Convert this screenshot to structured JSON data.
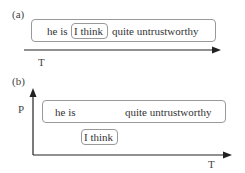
{
  "panel_a": {
    "label": "(a)",
    "words": [
      "he is",
      "I think",
      "quite untrustworthy"
    ],
    "axis_label": "T"
  },
  "panel_b": {
    "label": "(b)",
    "words_top": [
      "he is",
      "quite untrustworthy"
    ],
    "word_bottom": "I think",
    "y_axis_label": "P",
    "x_axis_label": "T"
  }
}
